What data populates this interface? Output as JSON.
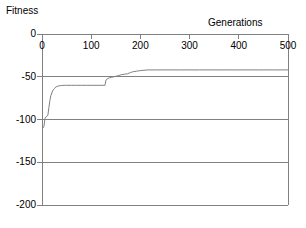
{
  "chart_data": {
    "type": "line",
    "title": "",
    "xlabel": "Generations",
    "ylabel": "Fitness",
    "xlim": [
      0,
      500
    ],
    "ylim": [
      -200,
      0
    ],
    "xticks": [
      0,
      100,
      200,
      300,
      400,
      500
    ],
    "xtick_labels": [
      "0",
      "100",
      "200",
      "300",
      "400",
      "500"
    ],
    "yticks": [
      0,
      -50,
      -100,
      -150,
      -200
    ],
    "ytick_labels": [
      "0",
      "-50",
      "-100",
      "-150",
      "-200"
    ],
    "grid": "horizontal",
    "legend": "none",
    "xaxis_position": "top",
    "line_color": "#808080",
    "axis_color": "#808080",
    "background_color": "#ffffff",
    "text_color": "#000000",
    "series": [
      {
        "name": "best fitness",
        "x": [
          0,
          2,
          4,
          6,
          8,
          10,
          12,
          14,
          16,
          18,
          20,
          22,
          25,
          28,
          32,
          36,
          40,
          45,
          50,
          60,
          70,
          80,
          90,
          100,
          110,
          120,
          128,
          130,
          134,
          138,
          142,
          146,
          150,
          156,
          162,
          168,
          174,
          180,
          186,
          192,
          198,
          205,
          215,
          230,
          250,
          280,
          320,
          360,
          400,
          440,
          470,
          500
        ],
        "y": [
          -110,
          -110,
          -108,
          -99,
          -97,
          -96,
          -95,
          -86,
          -78,
          -72,
          -69,
          -66,
          -64,
          -62,
          -61,
          -60.5,
          -60.2,
          -60,
          -60,
          -60,
          -60,
          -60,
          -60,
          -60,
          -60,
          -60,
          -60,
          -54,
          -52,
          -51,
          -50.5,
          -50,
          -49.5,
          -48.5,
          -47.5,
          -47,
          -46.5,
          -45,
          -44,
          -43.5,
          -43,
          -42.5,
          -42,
          -42,
          -42,
          -42,
          -42,
          -42,
          -42,
          -42,
          -42,
          -42
        ]
      }
    ],
    "annotations": [
      {
        "text": "steep initial improvement",
        "x_range": [
          0,
          25
        ]
      },
      {
        "text": "plateau near -60",
        "x_range": [
          25,
          130
        ]
      },
      {
        "text": "step improvement",
        "x_range": [
          130,
          200
        ]
      },
      {
        "text": "converged plateau near -42",
        "x_range": [
          200,
          500
        ]
      }
    ]
  }
}
